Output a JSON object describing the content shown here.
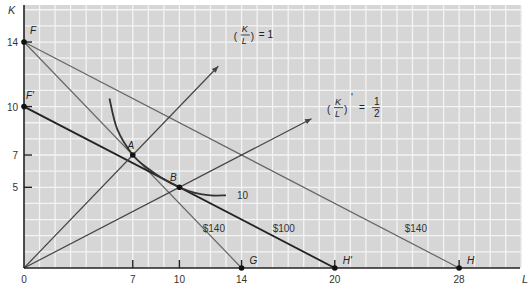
{
  "chart_data": {
    "type": "line",
    "title": "",
    "xlabel": "L",
    "ylabel": "K",
    "xlim": [
      0,
      32
    ],
    "ylim": [
      0,
      16
    ],
    "grid": true,
    "x_ticks": [
      {
        "value": 0,
        "label": "0"
      },
      {
        "value": 7,
        "label": "7"
      },
      {
        "value": 10,
        "label": "10"
      },
      {
        "value": 14,
        "label": "14"
      },
      {
        "value": 20,
        "label": "20"
      },
      {
        "value": 28,
        "label": "28"
      }
    ],
    "y_ticks": [
      {
        "value": 5,
        "label": "5"
      },
      {
        "value": 7,
        "label": "7"
      },
      {
        "value": 10,
        "label": "10"
      },
      {
        "value": 14,
        "label": "14"
      }
    ],
    "series": [
      {
        "name": "$140 (FG)",
        "label": "$140",
        "kind": "isocost",
        "points": [
          [
            0,
            14
          ],
          [
            14,
            0
          ]
        ],
        "color": "#666666",
        "label_at": [
          11.5,
          2.5
        ]
      },
      {
        "name": "$140 (FH)",
        "label": "$140",
        "kind": "isocost",
        "points": [
          [
            0,
            14
          ],
          [
            28,
            0
          ]
        ],
        "color": "#666666",
        "label_at": [
          24.5,
          2.5
        ]
      },
      {
        "name": "$100 (F'H')",
        "label": "$100",
        "kind": "isocost",
        "points": [
          [
            0,
            10
          ],
          [
            20,
            0
          ]
        ],
        "color": "#222222",
        "label_at": [
          16,
          2.5
        ]
      },
      {
        "name": "(K/L) = 1",
        "kind": "ray",
        "points": [
          [
            0,
            0
          ],
          [
            12.5,
            12.5
          ]
        ],
        "color": "#444444"
      },
      {
        "name": "(K/L)' = 1/2",
        "kind": "ray",
        "points": [
          [
            0,
            0
          ],
          [
            18.5,
            9.25
          ]
        ],
        "color": "#444444"
      },
      {
        "name": "Isoquant 10",
        "label": "10",
        "kind": "isoquant",
        "points": [
          [
            5.5,
            10.5
          ],
          [
            6,
            8.6
          ],
          [
            7,
            7
          ],
          [
            8,
            6.15
          ],
          [
            9,
            5.5
          ],
          [
            10,
            5
          ],
          [
            11,
            4.65
          ],
          [
            12,
            4.5
          ],
          [
            13,
            4.5
          ]
        ],
        "color": "#333333",
        "label_at": [
          13.7,
          4.5
        ]
      }
    ],
    "points": [
      {
        "name": "F",
        "x": 0,
        "y": 14
      },
      {
        "name": "F'",
        "x": 0,
        "y": 10
      },
      {
        "name": "A",
        "x": 7,
        "y": 7
      },
      {
        "name": "B",
        "x": 10,
        "y": 5
      },
      {
        "name": "G",
        "x": 14,
        "y": 0
      },
      {
        "name": "H'",
        "x": 20,
        "y": 0
      },
      {
        "name": "H",
        "x": 28,
        "y": 0
      }
    ],
    "annotations": [
      {
        "name": "ratio-1",
        "text_num": "K",
        "text_den": "L",
        "prime": "",
        "rhs": "= 1",
        "at": [
          13.5,
          14.5
        ]
      },
      {
        "name": "ratio-half",
        "text_num": "K",
        "text_den": "L",
        "prime": "'",
        "rhs_num": "1",
        "rhs_den": "2",
        "at": [
          19.5,
          10
        ]
      }
    ],
    "colors": {
      "background": "#d6d6d6",
      "grid": "#f4f4f4",
      "axis": "#222222"
    }
  }
}
